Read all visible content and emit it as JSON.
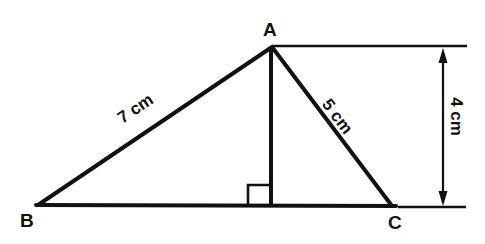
{
  "diagram": {
    "background_color": "#ffffff",
    "stroke_color": "#111111",
    "vertices": [
      {
        "name": "A",
        "label": "A",
        "x": 272,
        "y": 47
      },
      {
        "name": "B",
        "label": "B",
        "x": 38,
        "y": 205
      },
      {
        "name": "C",
        "label": "C",
        "x": 392,
        "y": 206
      }
    ],
    "sides": [
      {
        "name": "AB",
        "label": "7 cm",
        "length_value": 7,
        "unit": "cm"
      },
      {
        "name": "AC",
        "label": "5 cm",
        "length_value": 5,
        "unit": "cm"
      },
      {
        "name": "BC",
        "label": "",
        "length_value": null,
        "unit": "cm"
      }
    ],
    "altitude": {
      "from_vertex": "A",
      "foot_x": 271,
      "foot_y": 206,
      "label": "4 cm",
      "length_value": 4,
      "unit": "cm",
      "right_angle_marked": true
    },
    "dimension": {
      "label": "4 cm",
      "orientation": "vertical",
      "arrow_top": true,
      "arrow_bottom": true
    }
  }
}
